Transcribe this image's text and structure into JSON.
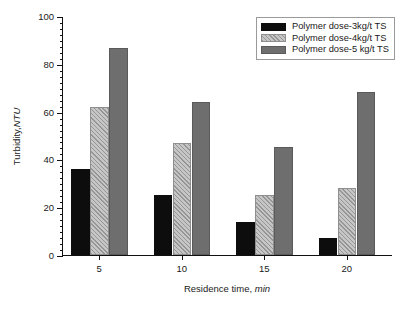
{
  "chart_data": {
    "type": "bar",
    "title": "",
    "subtitle": "",
    "xlabel_prefix": "Residence time, ",
    "xlabel_italic": "min",
    "ylabel_prefix": "Turbidity, ",
    "ylabel_italic": "NTU",
    "categories": [
      "5",
      "10",
      "15",
      "20"
    ],
    "series": [
      {
        "name": "Polymer dose-3kg/t TS",
        "color": "#0d0d0d",
        "fill": "solid-black",
        "values": [
          36,
          25,
          14,
          7
        ]
      },
      {
        "name": "Polymer dose-4kg/t TS",
        "color": "#c6c6c6",
        "fill": "hatched-light",
        "values": [
          62,
          47,
          25,
          28
        ]
      },
      {
        "name": "Polymer dose-5 kg/t TS",
        "color": "#6e6e6e",
        "fill": "solid-gray",
        "values": [
          86.5,
          64,
          45,
          68
        ]
      }
    ],
    "ylim": [
      0,
      100
    ],
    "ymajor_ticks": [
      0,
      20,
      40,
      60,
      80,
      100
    ],
    "ytick_labels": [
      "0",
      "20",
      "40",
      "60",
      "80",
      "100"
    ],
    "yminor_step": 2.5,
    "grid": false,
    "legend_position": "top-right",
    "axis_color": "#111111",
    "background": "#ffffff"
  }
}
